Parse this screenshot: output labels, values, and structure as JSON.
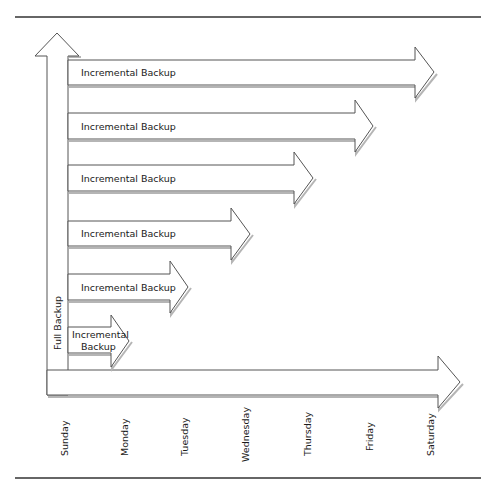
{
  "diagram": {
    "full_backup": {
      "label": "Full Backup",
      "day": "Sunday"
    },
    "timeline_axis": {
      "days": [
        "Sunday",
        "Monday",
        "Tuesday",
        "Wednesday",
        "Thursday",
        "Friday",
        "Saturday"
      ]
    },
    "incremental_backups": [
      {
        "label": "Incremental Backup",
        "ends_on": "Saturday"
      },
      {
        "label": "Incremental Backup",
        "ends_on": "Friday"
      },
      {
        "label": "Incremental Backup",
        "ends_on": "Thursday"
      },
      {
        "label": "Incremental Backup",
        "ends_on": "Wednesday"
      },
      {
        "label": "Incremental Backup",
        "ends_on": "Tuesday"
      },
      {
        "label_line1": "Incremental",
        "label_line2": "Backup",
        "ends_on": "Monday"
      }
    ],
    "colors": {
      "stroke": "#555555",
      "fill": "#ffffff",
      "shadow": "#b5b5b5",
      "rule": "#333333",
      "text": "#1a1a1a"
    }
  }
}
